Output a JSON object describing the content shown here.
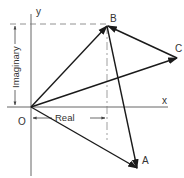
{
  "diagram": {
    "axes": {
      "x_label": "x",
      "y_label": "y",
      "origin_label": "O"
    },
    "points": [
      {
        "id": "O",
        "label": "O"
      },
      {
        "id": "A",
        "label": "A"
      },
      {
        "id": "B",
        "label": "B"
      },
      {
        "id": "C",
        "label": "C"
      }
    ],
    "dimensions": {
      "real_label": "Real",
      "imaginary_label": "Imaginary"
    },
    "vectors": [
      {
        "from": "O",
        "to": "B"
      },
      {
        "from": "O",
        "to": "C"
      },
      {
        "from": "O",
        "to": "A"
      },
      {
        "from": "C",
        "to": "B"
      },
      {
        "from": "B",
        "to": "A"
      }
    ],
    "colors": {
      "line": "#1a1a1a",
      "axis": "#555555",
      "guide": "#777777"
    }
  }
}
